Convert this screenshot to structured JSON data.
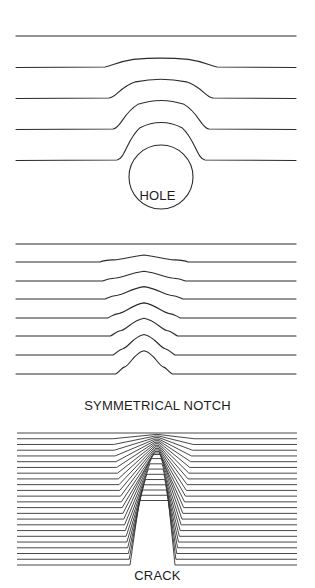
{
  "panels": [
    {
      "id": "hole",
      "label": "HOLE",
      "line_count": 5,
      "line_y": [
        16,
        47,
        78,
        109,
        140
      ],
      "x_start": 16,
      "x_end": 296,
      "hole_circle": {
        "cx": 161,
        "cy": 157,
        "r": 32
      }
    },
    {
      "id": "notch",
      "label": "SYMMETRICAL NOTCH",
      "line_count": 8,
      "line_y": [
        9,
        27,
        46,
        64,
        83,
        101,
        120,
        139
      ],
      "x_start": 16,
      "x_end": 296
    },
    {
      "id": "crack",
      "label": "CRACK",
      "line_count": 24,
      "line_y_start": 18,
      "line_y_end": 150,
      "x_start": 17,
      "x_end": 297,
      "crack_tip_x": 157
    }
  ],
  "colors": {
    "line": "#2b2b2b",
    "background": "#ffffff",
    "text": "#1c1c1c"
  }
}
